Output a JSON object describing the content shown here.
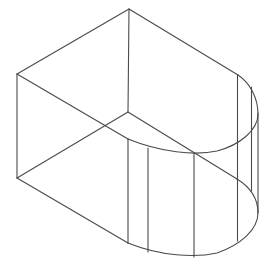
{
  "diagram": {
    "stroke_color": "#4a4a4a",
    "background": "#ffffff",
    "vertices": {
      "top": [
        129,
        9
      ],
      "left_top": [
        17,
        74
      ],
      "left_bottom": [
        17,
        178
      ],
      "inner": [
        128,
        112
      ],
      "right_top": [
        238,
        75
      ],
      "arc_top_left_end": [
        128,
        139
      ],
      "arc_bottom_left_end": [
        128,
        243
      ]
    },
    "lines": [
      {
        "name": "top-left-edge",
        "d": "M129,9 L17,74"
      },
      {
        "name": "top-right-edge",
        "d": "M129,9 L238,75"
      },
      {
        "name": "back-vertical-edge",
        "d": "M129,9 L128,112"
      },
      {
        "name": "left-vertical-edge",
        "d": "M17,74 L17,178"
      },
      {
        "name": "top-diagonal-edge",
        "d": "M17,74 L128,139"
      },
      {
        "name": "inner-to-left-bottom-edge",
        "d": "M128,112 L17,178"
      },
      {
        "name": "inner-to-lower-arc-edge",
        "d": "M128,112 L237,179"
      },
      {
        "name": "bottom-left-edge",
        "d": "M17,178 L128,243"
      },
      {
        "name": "upper-arc",
        "d": "M238,75 C250,83 258,98 258,114 C258,130 240,145 217,151 C195,156 160,152 128,139"
      },
      {
        "name": "lower-arc",
        "d": "M237,179 C250,187 258,199 258,213 C258,230 240,245 217,253 C195,258 160,256 128,243"
      },
      {
        "name": "vertical-1",
        "d": "M128,139 L128,243"
      },
      {
        "name": "vertical-2",
        "d": "M148,148 L148,252"
      },
      {
        "name": "vertical-3",
        "d": "M194,153 L194,257"
      },
      {
        "name": "vertical-4",
        "d": "M237.5,75 L237.5,241"
      },
      {
        "name": "vertical-5",
        "d": "M251.5,87 L251.5,191"
      },
      {
        "name": "right-silhouette",
        "d": "M258,113 L258,213"
      }
    ]
  }
}
